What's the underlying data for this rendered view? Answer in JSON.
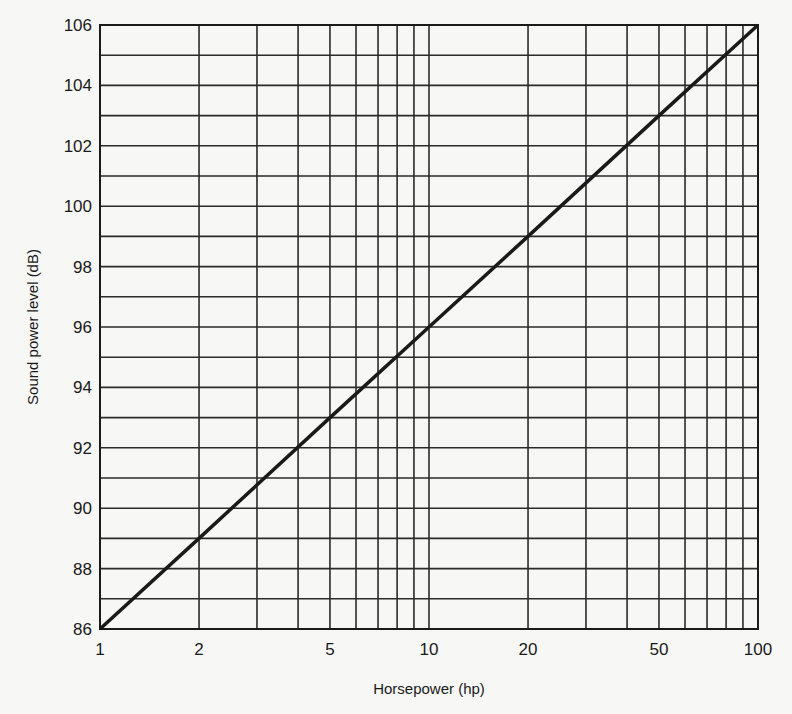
{
  "chart_data": {
    "type": "line",
    "title": "",
    "xlabel": "Horsepower (hp)",
    "ylabel": "Sound power level (dB)",
    "x_scale": "log",
    "xlim": [
      1,
      100
    ],
    "ylim": [
      86,
      106
    ],
    "x_ticks": [
      1,
      2,
      5,
      10,
      20,
      50,
      100
    ],
    "x_tick_labels": [
      "1",
      "2",
      "5",
      "10",
      "20",
      "50",
      "100"
    ],
    "x_minor_gridlines": [
      1,
      2,
      3,
      4,
      5,
      6,
      7,
      8,
      9,
      10,
      20,
      30,
      40,
      50,
      60,
      70,
      80,
      90,
      100
    ],
    "y_ticks": [
      86,
      88,
      90,
      92,
      94,
      96,
      98,
      100,
      102,
      104,
      106
    ],
    "y_tick_labels": [
      "86",
      "88",
      "90",
      "92",
      "94",
      "96",
      "98",
      "100",
      "102",
      "104",
      "106"
    ],
    "y_gridline_step": 1,
    "grid": true,
    "legend": null,
    "series": [
      {
        "name": "Sound power level",
        "x": [
          1,
          2,
          5,
          10,
          20,
          50,
          100
        ],
        "y": [
          86,
          89,
          93,
          96,
          99,
          103,
          106
        ]
      }
    ],
    "colors": {
      "line": "#1a1a1a",
      "grid": "#2a2a2a",
      "background": "#f7f7f5"
    }
  }
}
